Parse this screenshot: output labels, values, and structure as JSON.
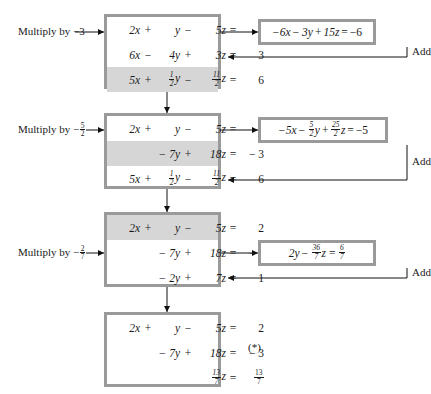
{
  "diagram": {
    "star_marker": "(*)",
    "add_label": "Add",
    "multiply_prefix": "Multiply by",
    "colors": {
      "box_border": "#9a9a9a",
      "row_shade": "#d6d6d6",
      "background": "#ffffff",
      "text": "#1a1a1a"
    }
  },
  "steps": [
    {
      "id": "step-1",
      "multiply_label": "Multiply by −3",
      "multiplier": "-3",
      "source_row": 1,
      "target_row": 2,
      "add_label": "Add",
      "side_equation": {
        "terms": [
          "−6x",
          "−",
          "3y",
          "+",
          "15z"
        ],
        "text": "−6x − 3y + 15z = −6",
        "rhs": "−6"
      },
      "rows": [
        {
          "shaded": false,
          "c1": "2x",
          "op1": "+",
          "c2": "y",
          "op2": "−",
          "c3": "5z",
          "eq": "=",
          "rhs": "2"
        },
        {
          "shaded": false,
          "c1": "6x",
          "op1": "−",
          "c2": "4y",
          "op2": "+",
          "c3": "3z",
          "eq": "=",
          "rhs": "3"
        },
        {
          "shaded": true,
          "c1": "5x",
          "op1": "+",
          "c2": "½y",
          "op2": "−",
          "c3": "11/2 z",
          "eq": "=",
          "rhs": "6"
        }
      ]
    },
    {
      "id": "step-2",
      "multiply_label": "Multiply by − 5/2",
      "multiplier": "-5/2",
      "source_row": 1,
      "target_row": 3,
      "add_label": "Add",
      "side_equation": {
        "text": "−5x − 5/2 y + 25/2 z = −5",
        "rhs": "−5"
      },
      "rows": [
        {
          "shaded": false,
          "c1": "2x",
          "op1": "+",
          "c2": "y",
          "op2": "−",
          "c3": "5z",
          "eq": "=",
          "rhs": "2"
        },
        {
          "shaded": true,
          "c1": "",
          "op1": "",
          "c2": "− 7y",
          "op2": "+",
          "c3": "18z",
          "eq": "=",
          "rhs": "− 3"
        },
        {
          "shaded": false,
          "c1": "5x",
          "op1": "+",
          "c2": "½y",
          "op2": "−",
          "c3": "11/2 z",
          "eq": "=",
          "rhs": "6"
        }
      ]
    },
    {
      "id": "step-3",
      "multiply_label": "Multiply by − 2/7",
      "multiplier": "-2/7",
      "source_row": 2,
      "target_row": 3,
      "add_label": "Add",
      "side_equation": {
        "text": "2y − 36/7 z = 6/7",
        "rhs": "6/7"
      },
      "rows": [
        {
          "shaded": true,
          "c1": "2x",
          "op1": "+",
          "c2": "y",
          "op2": "−",
          "c3": "5z",
          "eq": "=",
          "rhs": "2"
        },
        {
          "shaded": false,
          "c1": "",
          "op1": "",
          "c2": "− 7y",
          "op2": "+",
          "c3": "18z",
          "eq": "=",
          "rhs": "− 3"
        },
        {
          "shaded": false,
          "c1": "",
          "op1": "",
          "c2": "− 2y",
          "op2": "+",
          "c3": "7z",
          "eq": "=",
          "rhs": "1"
        }
      ]
    },
    {
      "id": "step-4",
      "multiply_label": "",
      "add_label": "",
      "rows": [
        {
          "shaded": false,
          "c1": "2x",
          "op1": "+",
          "c2": "y",
          "op2": "−",
          "c3": "5z",
          "eq": "=",
          "rhs": "2"
        },
        {
          "shaded": false,
          "c1": "",
          "op1": "",
          "c2": "− 7y",
          "op2": "+",
          "c3": "18z",
          "eq": "=",
          "rhs": "− 3"
        },
        {
          "shaded": false,
          "c1": "",
          "op1": "",
          "c2": "",
          "op2": "",
          "c3": "13/7 z",
          "eq": "=",
          "rhs": "13/7"
        }
      ]
    }
  ],
  "text": {
    "mul1": "Multiply by −3",
    "mul2_prefix": "Multiply by −",
    "mul2_num": "5",
    "mul2_den": "2",
    "mul3_prefix": "Multiply by −",
    "mul3_num": "2",
    "mul3_den": "7",
    "add": "Add",
    "star": "(*)"
  },
  "equations": {
    "b1r1": {
      "c1": "2x",
      "op1": "+",
      "c2": "y",
      "op2": "−",
      "c3": "5z",
      "eq": "=",
      "rhs": "2"
    },
    "b1r2": {
      "c1": "6x",
      "op1": "−",
      "c2": "4y",
      "op2": "+",
      "c3": "3z",
      "eq": "=",
      "rhs": "3"
    },
    "b1r3": {
      "c1": "5x",
      "op1": "+",
      "c2": "y",
      "op2": "−",
      "c3": "z",
      "eq": "=",
      "rhs": "6"
    },
    "b2r1": {
      "c1": "2x",
      "op1": "+",
      "c2": "y",
      "op2": "−",
      "c3": "5z",
      "eq": "=",
      "rhs": "2"
    },
    "b2r2": {
      "c1": "",
      "op1": "",
      "c2": "− 7y",
      "op2": "+",
      "c3": "18z",
      "eq": "=",
      "rhs": "− 3"
    },
    "b2r3": {
      "c1": "5x",
      "op1": "+",
      "c2": "y",
      "op2": "−",
      "c3": "z",
      "eq": "=",
      "rhs": "6"
    },
    "b3r1": {
      "c1": "2x",
      "op1": "+",
      "c2": "y",
      "op2": "−",
      "c3": "5z",
      "eq": "=",
      "rhs": "2"
    },
    "b3r2": {
      "c1": "",
      "op1": "",
      "c2": "− 7y",
      "op2": "+",
      "c3": "18z",
      "eq": "=",
      "rhs": "− 3"
    },
    "b3r3": {
      "c1": "",
      "op1": "",
      "c2": "− 2y",
      "op2": "+",
      "c3": "7z",
      "eq": "=",
      "rhs": "1"
    },
    "b4r1": {
      "c1": "2x",
      "op1": "+",
      "c2": "y",
      "op2": "−",
      "c3": "5z",
      "eq": "=",
      "rhs": "2"
    },
    "b4r2": {
      "c1": "",
      "op1": "",
      "c2": "− 7y",
      "op2": "+",
      "c3": "18z",
      "eq": "=",
      "rhs": "− 3"
    },
    "b4r3": {
      "c1": "",
      "op1": "",
      "c2": "",
      "op2": "",
      "c3": "z",
      "eq": "=",
      "rhs": ""
    }
  },
  "side": {
    "s1": {
      "a": "−6x",
      "op1": "−",
      "b": "3y",
      "op2": "+",
      "c": "15z",
      "eq": "=",
      "rhs": "−6"
    },
    "s2": {
      "a": "−5x",
      "op1": "−",
      "bnum": "5",
      "bden": "2",
      "bvar": "y",
      "op2": "+",
      "cnum": "25",
      "cden": "2",
      "cvar": "z",
      "eq": "=",
      "rhs": "−5"
    },
    "s3": {
      "a": "2y",
      "op1": "−",
      "cnum": "36",
      "cden": "7",
      "cvar": "z",
      "eq": "=",
      "rnum": "6",
      "rden": "7"
    }
  },
  "fractions": {
    "half_num": "1",
    "half_den": "2",
    "eleven_num": "11",
    "eleven_den": "2",
    "thirteen_num": "13",
    "thirteen_den": "7"
  }
}
